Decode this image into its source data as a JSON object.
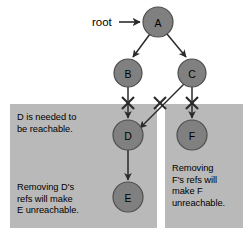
{
  "diagram": {
    "colors": {
      "page_background": "#ffffff",
      "panel_fill": "#b9b9b9",
      "node_fill": "#808080",
      "node_stroke": "#4d4d4d",
      "line": "#333333",
      "text": "#000000"
    },
    "root_label": "root",
    "nodes": [
      {
        "id": "A",
        "label": "A",
        "cx": 158,
        "cy": 22,
        "r": 15
      },
      {
        "id": "B",
        "label": "B",
        "cx": 128,
        "cy": 73,
        "r": 14
      },
      {
        "id": "C",
        "label": "C",
        "cx": 192,
        "cy": 73,
        "r": 14
      },
      {
        "id": "D",
        "label": "D",
        "cx": 128,
        "cy": 135,
        "r": 15
      },
      {
        "id": "F",
        "label": "F",
        "cx": 192,
        "cy": 135,
        "r": 15
      },
      {
        "id": "E",
        "label": "E",
        "cx": 128,
        "cy": 197,
        "r": 15
      }
    ],
    "edges": [
      {
        "id": "root-to-a",
        "from": "root",
        "to": "A",
        "crossed": false
      },
      {
        "id": "a-to-b",
        "from": "A",
        "to": "B",
        "crossed": false
      },
      {
        "id": "a-to-c",
        "from": "A",
        "to": "C",
        "crossed": false
      },
      {
        "id": "b-to-d",
        "from": "B",
        "to": "D",
        "crossed": true
      },
      {
        "id": "c-to-d",
        "from": "C",
        "to": "D",
        "crossed": true
      },
      {
        "id": "c-to-f",
        "from": "C",
        "to": "F",
        "crossed": true
      },
      {
        "id": "d-to-e",
        "from": "D",
        "to": "E",
        "crossed": false
      }
    ],
    "cut_marks": [
      {
        "id": "cut-b-d",
        "x": 128,
        "y": 103
      },
      {
        "id": "cut-c-d",
        "x": 160,
        "y": 103
      },
      {
        "id": "cut-c-f",
        "x": 192,
        "y": 103
      }
    ],
    "panels": [
      {
        "id": "left-panel",
        "x": 10,
        "y": 104,
        "width": 147,
        "height": 124,
        "notes": [
          {
            "id": "d-needed",
            "text": "D is needed to\nbe reachable."
          },
          {
            "id": "removing-d",
            "text": "Removing D's\nrefs will make\nE unreachable."
          }
        ]
      },
      {
        "id": "right-panel",
        "x": 165,
        "y": 104,
        "width": 78,
        "height": 124,
        "notes": [
          {
            "id": "removing-f",
            "text": "Removing\nF's refs will\nmake F\nunreachable."
          }
        ]
      }
    ]
  }
}
